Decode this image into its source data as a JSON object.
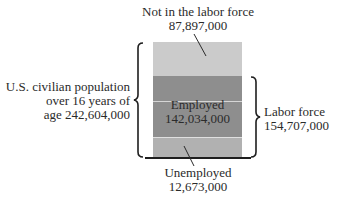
{
  "diagram": {
    "top_label": {
      "title": "Not in the labor force",
      "value": "87,897,000"
    },
    "left_label": {
      "line1": "U.S. civilian population",
      "line2": "over 16 years of",
      "line3": "age 242,604,000"
    },
    "employed_label": {
      "title": "Employed",
      "value": "142,034,000"
    },
    "right_label": {
      "title": "Labor force",
      "value": "154,707,000"
    },
    "bottom_label": {
      "title": "Unemployed",
      "value": "12,673,000"
    },
    "colors": {
      "not_in_labor_force": "#cbcbcb",
      "employed": "#8e8e8e",
      "unemployed": "#b1b1b1",
      "text": "#2a2a2a",
      "bracket": "#1e1e1e"
    },
    "icons": {
      "left_bracket": "curly-brace-left",
      "right_bracket": "curly-brace-right"
    }
  }
}
